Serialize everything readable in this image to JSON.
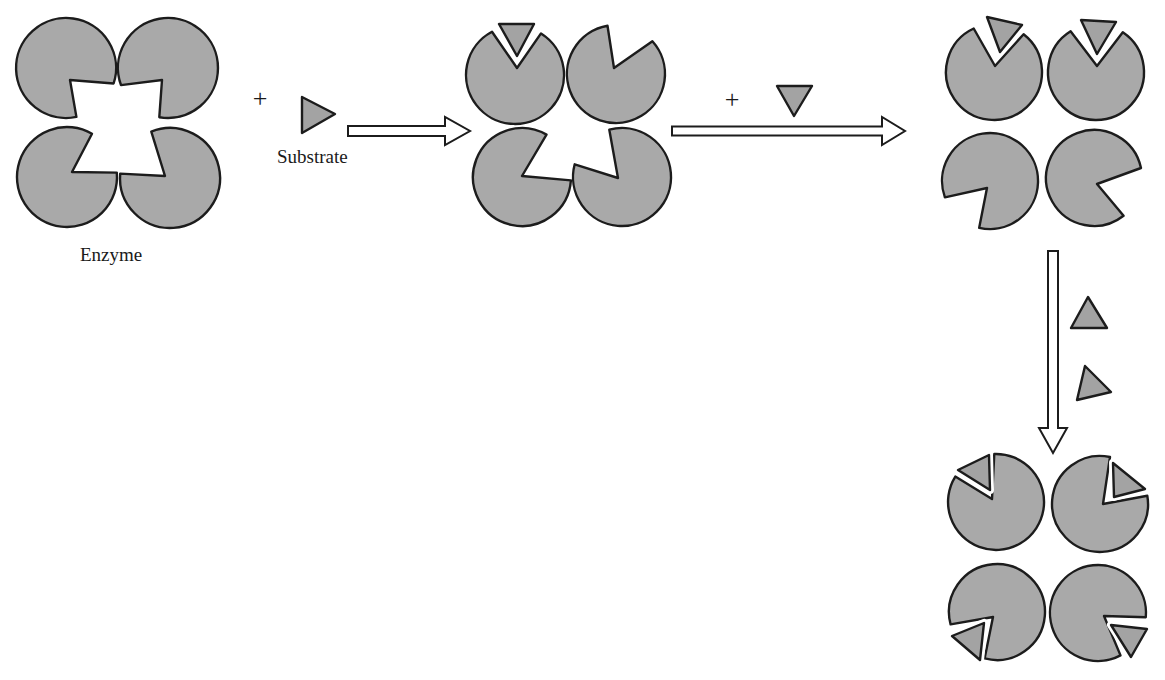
{
  "colors": {
    "subunit_fill": "#a9a9a9",
    "substrate_fill": "#a3a3a3",
    "outline": "#1c1c1c",
    "background": "#ffffff"
  },
  "labels": {
    "enzyme": "Enzyme",
    "substrate": "Substrate",
    "plus_1": "+",
    "plus_2": "+"
  },
  "stages": [
    {
      "name": "free-enzyme",
      "r": 50,
      "subunits": [
        {
          "pos": "top-left",
          "cx": 66,
          "cy": 68,
          "a1": 18,
          "a2": 78,
          "vx": 70,
          "vy": 80,
          "bound": null
        },
        {
          "pos": "top-right",
          "cx": 168,
          "cy": 68,
          "a1": 100,
          "a2": 160,
          "vx": 162,
          "vy": 80,
          "bound": null
        },
        {
          "pos": "bottom-left",
          "cx": 67,
          "cy": 177,
          "a1": -60,
          "a2": -5,
          "vx": 72,
          "vy": 172,
          "bound": null
        },
        {
          "pos": "bottom-right",
          "cx": 170,
          "cy": 178,
          "a1": 185,
          "a2": 248,
          "vx": 165,
          "vy": 176,
          "bound": null
        }
      ]
    },
    {
      "name": "one-substrate-bound",
      "r": 49,
      "subunits": [
        {
          "pos": "top-left",
          "cx": 515,
          "cy": 75,
          "a1": -118,
          "a2": -58,
          "vx": 517,
          "vy": 68,
          "bound": [
            [
              499,
              24
            ],
            [
              534,
              24
            ],
            [
              517,
              56
            ]
          ]
        },
        {
          "pos": "top-right",
          "cx": 616,
          "cy": 74,
          "a1": -100,
          "a2": -42,
          "vx": 614,
          "vy": 68,
          "bound": null
        },
        {
          "pos": "bottom-left",
          "cx": 522,
          "cy": 177,
          "a1": -60,
          "a2": 4,
          "vx": 522,
          "vy": 176,
          "bound": null
        },
        {
          "pos": "bottom-right",
          "cx": 622,
          "cy": 177,
          "a1": 195,
          "a2": 255,
          "vx": 618,
          "vy": 178,
          "bound": null
        }
      ]
    },
    {
      "name": "two-substrates-bound",
      "r": 48,
      "subunits": [
        {
          "pos": "top-left",
          "cx": 994,
          "cy": 72,
          "a1": -115,
          "a2": -52,
          "vx": 995,
          "vy": 66,
          "bound": [
            [
              987,
              17
            ],
            [
              1022,
              25
            ],
            [
              1000,
              52
            ]
          ]
        },
        {
          "pos": "top-right",
          "cx": 1096,
          "cy": 72,
          "a1": -122,
          "a2": -56,
          "vx": 1097,
          "vy": 66,
          "bound": [
            [
              1081,
              20
            ],
            [
              1116,
              22
            ],
            [
              1097,
              54
            ]
          ]
        },
        {
          "pos": "bottom-left",
          "cx": 990,
          "cy": 181,
          "a1": 103,
          "a2": 160,
          "vx": 987,
          "vy": 188,
          "bound": null
        },
        {
          "pos": "bottom-right",
          "cx": 1094,
          "cy": 178,
          "a1": -12,
          "a2": 52,
          "vx": 1097,
          "vy": 184,
          "bound": null
        }
      ]
    },
    {
      "name": "fully-bound",
      "r": 48,
      "subunits": [
        {
          "pos": "top-left",
          "cx": 996,
          "cy": 502,
          "a1": -148,
          "a2": -92,
          "vx": 992,
          "vy": 499,
          "bound": [
            [
              958,
              470
            ],
            [
              989,
              455
            ],
            [
              990,
              490
            ]
          ]
        },
        {
          "pos": "top-right",
          "cx": 1100,
          "cy": 504,
          "a1": -78,
          "a2": -10,
          "vx": 1103,
          "vy": 504,
          "bound": [
            [
              1113,
              463
            ],
            [
              1145,
              489
            ],
            [
              1114,
              497
            ]
          ]
        },
        {
          "pos": "bottom-left",
          "cx": 997,
          "cy": 612,
          "a1": 105,
          "a2": 165,
          "vx": 993,
          "vy": 617,
          "bound": [
            [
              952,
              636
            ],
            [
              984,
              623
            ],
            [
              980,
              660
            ]
          ]
        },
        {
          "pos": "bottom-right",
          "cx": 1098,
          "cy": 613,
          "a1": 5,
          "a2": 62,
          "vx": 1104,
          "vy": 616,
          "bound": [
            [
              1111,
              625
            ],
            [
              1147,
              629
            ],
            [
              1131,
              657
            ]
          ]
        }
      ]
    }
  ],
  "free_substrates": [
    {
      "name": "substrate-1",
      "points": [
        [
          302,
          97
        ],
        [
          335,
          114
        ],
        [
          302,
          133
        ]
      ]
    },
    {
      "name": "substrate-2",
      "points": [
        [
          777,
          86
        ],
        [
          812,
          86
        ],
        [
          794,
          116
        ]
      ]
    },
    {
      "name": "substrate-3",
      "points": [
        [
          1088,
          297
        ],
        [
          1107,
          328
        ],
        [
          1071,
          328
        ]
      ]
    },
    {
      "name": "substrate-4",
      "points": [
        [
          1085,
          366
        ],
        [
          1111,
          392
        ],
        [
          1077,
          400
        ]
      ]
    }
  ],
  "arrows": [
    {
      "name": "arrow-step-1",
      "dir": "right",
      "x1": 348,
      "x2": 470,
      "y": 131,
      "shaft": 10,
      "head_len": 25,
      "head_w": 28
    },
    {
      "name": "arrow-step-2",
      "dir": "right",
      "x1": 672,
      "x2": 905,
      "y": 131,
      "shaft": 9,
      "head_len": 23,
      "head_w": 28
    },
    {
      "name": "arrow-step-3",
      "dir": "down",
      "x": 1053,
      "y1": 251,
      "y2": 453,
      "shaft": 10,
      "head_len": 25,
      "head_w": 28
    }
  ]
}
